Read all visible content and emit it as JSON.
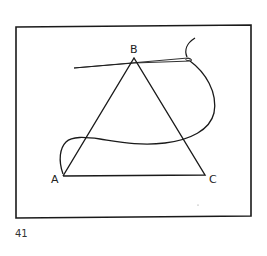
{
  "figure": {
    "number": "41",
    "vertices": {
      "A": {
        "label": "A",
        "x": 63,
        "y": 176
      },
      "B": {
        "label": "B",
        "x": 134,
        "y": 58
      },
      "C": {
        "label": "C",
        "x": 205,
        "y": 175
      }
    },
    "colors": {
      "stroke": "#1a1a1a",
      "background": "#ffffff"
    }
  }
}
